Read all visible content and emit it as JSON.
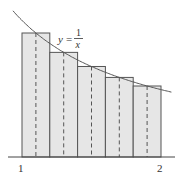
{
  "figure": {
    "function_label": {
      "lhs": "y",
      "num": "1",
      "den": "x"
    },
    "x_tick_labels": [
      "1",
      "2"
    ],
    "rule": "midpoint",
    "num_rectangles": 5,
    "colors": {
      "fill": "#e6e6e6",
      "stroke": "#555555",
      "curve": "#555555"
    }
  },
  "chart_data": {
    "type": "diagram",
    "function": "y = 1/x",
    "interval": [
      1,
      2
    ],
    "n": 5,
    "rectangles": [
      {
        "left": 1.0,
        "right": 1.2,
        "midpoint": 1.1,
        "height": 0.909
      },
      {
        "left": 1.2,
        "right": 1.4,
        "midpoint": 1.3,
        "height": 0.769
      },
      {
        "left": 1.4,
        "right": 1.6,
        "midpoint": 1.5,
        "height": 0.667
      },
      {
        "left": 1.6,
        "right": 1.8,
        "midpoint": 1.7,
        "height": 0.588
      },
      {
        "left": 1.8,
        "right": 2.0,
        "midpoint": 1.9,
        "height": 0.526
      }
    ],
    "xlabel": "",
    "ylabel": "",
    "x_ticks": [
      1,
      2
    ]
  }
}
